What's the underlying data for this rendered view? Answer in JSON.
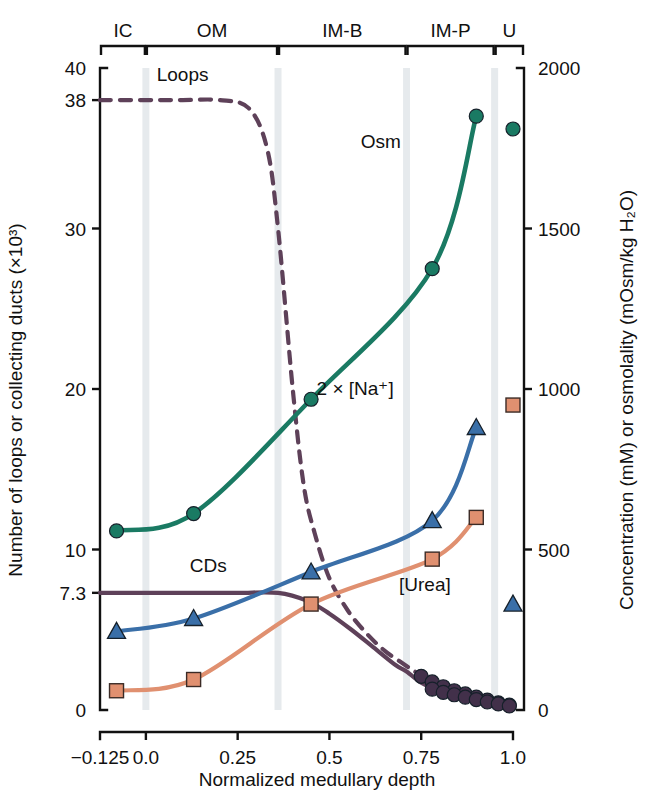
{
  "figure": {
    "title": "",
    "zones": [
      {
        "name": "IC",
        "label": "IC",
        "x_start": -0.125,
        "x_end": 0.0
      },
      {
        "name": "OM",
        "label": "OM",
        "x_start": 0.0,
        "x_end": 0.36
      },
      {
        "name": "IMB",
        "label": "IM-B",
        "x_start": 0.36,
        "x_end": 0.71
      },
      {
        "name": "IMP",
        "label": "IM-P",
        "x_start": 0.71,
        "x_end": 0.95
      },
      {
        "name": "U",
        "label": "U",
        "x_start": 0.95,
        "x_end": 1.03
      }
    ]
  },
  "chart_data": {
    "type": "line",
    "title": "",
    "xlabel": "Normalized medullary depth",
    "ylabel": "Number of loops or collecting ducts (×10³)",
    "y2label": "Concentration (mM) or osmolality (mOsm/kg H₂O)",
    "xlim": [
      -0.125,
      1.03
    ],
    "ylim": [
      0,
      40
    ],
    "y2lim": [
      0,
      2000
    ],
    "grid": false,
    "legend": "inline-labels",
    "xticks": [
      -0.125,
      0.0,
      0.25,
      0.5,
      0.75,
      1.0
    ],
    "xticklabels": [
      "−0.125",
      "0.0",
      "0.25",
      "0.5",
      "0.75",
      "1.0"
    ],
    "yticks": [
      0,
      7.3,
      10,
      20,
      30,
      38,
      40
    ],
    "yticklabels": [
      "0",
      "7.3",
      "10",
      "20",
      "30",
      "38",
      "40"
    ],
    "y2ticks": [
      0,
      500,
      1000,
      1500,
      2000
    ],
    "y2ticklabels": [
      "0",
      "500",
      "1000",
      "1500",
      "2000"
    ],
    "band_positions": [
      0.0,
      0.36,
      0.71,
      0.95
    ],
    "series": [
      {
        "name": "Loops",
        "label": "Loops",
        "axis": "left",
        "color": "#5e4159",
        "style": "dashed",
        "marker": "none",
        "x": [
          -0.125,
          0.0,
          0.1,
          0.2,
          0.28,
          0.33,
          0.36,
          0.4,
          0.43,
          0.46,
          0.5,
          0.55,
          0.6,
          0.65,
          0.7,
          0.74,
          0.78
        ],
        "y": [
          38,
          38,
          38,
          38,
          37.5,
          35,
          30,
          20,
          14,
          11,
          8.2,
          6.2,
          4.8,
          3.7,
          2.9,
          2.3,
          1.9
        ]
      },
      {
        "name": "CDs",
        "label": "CDs",
        "axis": "left",
        "color": "#5e4159",
        "style": "solid",
        "marker": "none",
        "x": [
          -0.125,
          0.0,
          0.12,
          0.25,
          0.36,
          0.44,
          0.5,
          0.56,
          0.62,
          0.68,
          0.71,
          0.75,
          0.78
        ],
        "y": [
          7.3,
          7.3,
          7.3,
          7.3,
          7.3,
          6.8,
          6.0,
          5.0,
          3.9,
          2.8,
          2.4,
          1.7,
          1.4
        ]
      },
      {
        "name": "Loops-tail-markers",
        "label": "",
        "axis": "left",
        "color": "#42304a",
        "style": "markers",
        "marker": "circle",
        "x": [
          0.75,
          0.78,
          0.81,
          0.84,
          0.87,
          0.9,
          0.93,
          0.96,
          0.99
        ],
        "y": [
          2.1,
          1.75,
          1.45,
          1.2,
          1.0,
          0.8,
          0.62,
          0.45,
          0.3
        ]
      },
      {
        "name": "CDs-tail-markers",
        "label": "",
        "axis": "left",
        "color": "#42304a",
        "style": "markers",
        "marker": "circle",
        "x": [
          0.78,
          0.81,
          0.84,
          0.87,
          0.9,
          0.93,
          0.96,
          0.99
        ],
        "y": [
          1.3,
          1.1,
          0.95,
          0.8,
          0.65,
          0.5,
          0.38,
          0.25
        ]
      },
      {
        "name": "Osm",
        "label": "Osm",
        "axis": "right",
        "color": "#1a7a63",
        "style": "solid",
        "marker": "circle",
        "x": [
          -0.08,
          0.13,
          0.45,
          0.78,
          0.9
        ],
        "y": [
          558,
          612,
          968,
          1375,
          1850
        ],
        "y_left_equiv": [
          11.2,
          12.3,
          19.4,
          27.5,
          37.0
        ]
      },
      {
        "name": "2 x [Na+]",
        "label": "2 × [Na⁺]",
        "axis": "right",
        "color": "#3a6fa8",
        "style": "solid",
        "marker": "triangle",
        "x": [
          -0.08,
          0.13,
          0.45,
          0.78,
          0.9
        ],
        "y": [
          245,
          285,
          430,
          590,
          880
        ],
        "y_left_equiv": [
          4.9,
          5.7,
          8.6,
          11.8,
          17.6
        ]
      },
      {
        "name": "[Urea]",
        "label": "[Urea]",
        "axis": "right",
        "color": "#e09070",
        "style": "solid",
        "marker": "square",
        "x": [
          -0.08,
          0.13,
          0.45,
          0.78,
          0.9
        ],
        "y": [
          60,
          95,
          330,
          470,
          600
        ],
        "y_left_equiv": [
          1.2,
          1.9,
          6.6,
          9.4,
          12.0
        ]
      }
    ],
    "urine_points": [
      {
        "name": "Osm-urine",
        "label": "",
        "marker": "circle",
        "color": "#1a7a63",
        "x": 1.0,
        "y": 1810
      },
      {
        "name": "Urea-urine",
        "label": "",
        "marker": "square",
        "color": "#e09070",
        "x": 1.0,
        "y": 950
      },
      {
        "name": "Na-urine",
        "label": "",
        "marker": "triangle",
        "color": "#3a6fa8",
        "x": 1.0,
        "y": 330
      }
    ],
    "annotations": [
      {
        "name": "loops-label",
        "text": "Loops",
        "x": 0.1,
        "y": 39.2
      },
      {
        "name": "cds-label",
        "text": "CDs",
        "x": 0.17,
        "y": 8.6
      },
      {
        "name": "osm-label",
        "text": "Osm",
        "x": 0.64,
        "y": 35.0
      },
      {
        "name": "na-label",
        "text": "2 × [Na⁺]",
        "x": 0.57,
        "y": 19.6
      },
      {
        "name": "urea-label",
        "text": "[Urea]",
        "x": 0.76,
        "y": 7.4
      }
    ]
  }
}
